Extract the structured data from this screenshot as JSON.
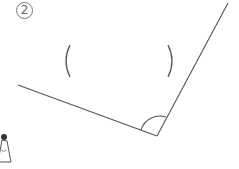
{
  "problem": {
    "number_label": "2",
    "answer_blank": {
      "left_paren": "(",
      "right_paren": ")",
      "value": ""
    }
  },
  "diagram": {
    "type": "angle",
    "vertex": [
      157,
      136
    ],
    "ray_left_end": [
      18,
      85
    ],
    "ray_right_end": [
      228,
      3
    ],
    "angle_arc": {
      "radius": 17,
      "marked": true
    },
    "line_color": "#555555"
  },
  "decoration": {
    "character_icon": "partial-figure-bottom-left"
  }
}
